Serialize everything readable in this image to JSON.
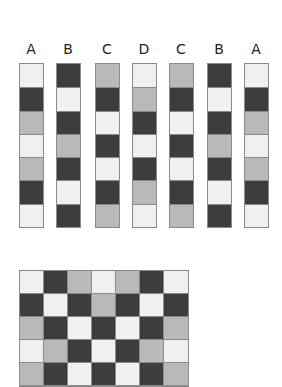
{
  "colors": {
    "L": "#f0f0f0",
    "M": "#b9b9b9",
    "D": "#3d3d3d",
    "border": "#8a8a8a"
  },
  "legend": {
    "L": "light",
    "M": "medium gray",
    "D": "dark"
  },
  "strips": [
    {
      "label": "A",
      "x": 19,
      "cells": [
        "L",
        "D",
        "M",
        "L",
        "M",
        "D",
        "L"
      ]
    },
    {
      "label": "B",
      "x": 56,
      "cells": [
        "D",
        "L",
        "D",
        "M",
        "D",
        "L",
        "D"
      ]
    },
    {
      "label": "C",
      "x": 95,
      "cells": [
        "M",
        "D",
        "L",
        "D",
        "L",
        "D",
        "M"
      ]
    },
    {
      "label": "D",
      "x": 132,
      "cells": [
        "L",
        "M",
        "D",
        "L",
        "D",
        "M",
        "L"
      ]
    },
    {
      "label": "C",
      "x": 169,
      "cells": [
        "M",
        "D",
        "L",
        "D",
        "L",
        "D",
        "M"
      ]
    },
    {
      "label": "B",
      "x": 207,
      "cells": [
        "D",
        "L",
        "D",
        "M",
        "D",
        "L",
        "D"
      ]
    },
    {
      "label": "A",
      "x": 244,
      "cells": [
        "L",
        "D",
        "M",
        "L",
        "M",
        "D",
        "L"
      ]
    }
  ],
  "woven_grid": {
    "columns": 7,
    "rows": [
      [
        "L",
        "D",
        "M",
        "L",
        "M",
        "D",
        "L"
      ],
      [
        "D",
        "L",
        "D",
        "M",
        "D",
        "L",
        "D"
      ],
      [
        "M",
        "D",
        "L",
        "D",
        "L",
        "D",
        "M"
      ],
      [
        "L",
        "M",
        "D",
        "L",
        "D",
        "M",
        "L"
      ],
      [
        "M",
        "D",
        "L",
        "D",
        "L",
        "D",
        "M"
      ]
    ]
  }
}
